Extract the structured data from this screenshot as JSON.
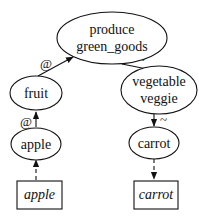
{
  "diagram": {
    "nodes": {
      "produce": {
        "line1": "produce",
        "line2": "green_goods",
        "shape": "ellipse"
      },
      "fruit": {
        "label": "fruit",
        "shape": "ellipse"
      },
      "vegetable": {
        "line1": "vegetable",
        "line2": "veggie",
        "shape": "ellipse"
      },
      "apple": {
        "label": "apple",
        "shape": "ellipse"
      },
      "carrot": {
        "label": "carrot",
        "shape": "ellipse"
      },
      "apple_word": {
        "label": "apple",
        "shape": "box",
        "style": "italic"
      },
      "carrot_word": {
        "label": "carrot",
        "shape": "box",
        "style": "italic"
      }
    },
    "edges": [
      {
        "from": "fruit",
        "to": "produce",
        "label": "@",
        "style": "solid"
      },
      {
        "from": "apple",
        "to": "fruit",
        "label": "@",
        "style": "solid"
      },
      {
        "from": "produce",
        "to": "vegetable",
        "label": "~",
        "style": "solid"
      },
      {
        "from": "vegetable",
        "to": "carrot",
        "label": "~",
        "style": "solid"
      },
      {
        "from": "apple_word",
        "to": "apple",
        "label": "",
        "style": "dashed"
      },
      {
        "from": "carrot",
        "to": "carrot_word",
        "label": "",
        "style": "dashed"
      }
    ],
    "edge_labels": {
      "fruit_produce": "@",
      "apple_fruit": "@",
      "produce_vegetable": "~",
      "vegetable_carrot": "~"
    }
  }
}
